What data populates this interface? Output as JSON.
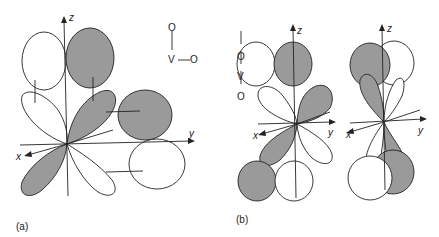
{
  "figure": {
    "panel_a": {
      "label": "(a)",
      "axes": {
        "z": "z",
        "y": "y",
        "x": "x"
      },
      "molecule": {
        "top": "O",
        "center": "V",
        "bond_h": "—",
        "right": "O"
      }
    },
    "panel_b": {
      "label": "(b)",
      "axes_left": {
        "z": "z",
        "y": "y",
        "x": "x"
      },
      "axes_right": {
        "z": "z",
        "y": "y",
        "x": "x"
      },
      "molecule": {
        "top": "O",
        "center": "V",
        "bottom": "O"
      }
    },
    "colors": {
      "shaded": "#9a9a9a",
      "line": "#222222",
      "background": "#ffffff"
    }
  }
}
